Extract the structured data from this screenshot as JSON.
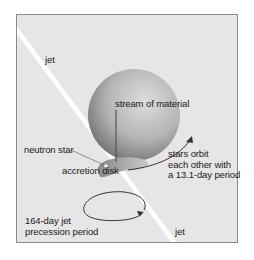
{
  "diagram": {
    "labels": {
      "jet_top": "jet",
      "jet_bottom": "jet",
      "stream": "stream of material",
      "neutron_star": "neutron star",
      "accretion_disk": "accretion disk",
      "orbit_line1": "stars orbit",
      "orbit_line2": "each other with",
      "orbit_line3": "a 13.1-day period",
      "precession_line1": "164-day jet",
      "precession_line2": "precession period"
    },
    "colors": {
      "background": "#e6e6e6",
      "border": "#8a8a8a",
      "jet": "#ffffff",
      "star_light": "#d8d8d8",
      "star_dark": "#6e6e6e",
      "text": "#1a1a1a"
    }
  }
}
